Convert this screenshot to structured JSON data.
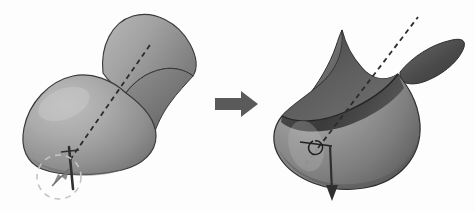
{
  "figure": {
    "type": "diagram",
    "background_color": "#fdfdfd",
    "panels": [
      {
        "id": "before",
        "name": "left-surface",
        "description": "Smooth closed grey surface with a large lower lobe and an upper flaring lobe, pierced by a dashed rotation axis",
        "surface_fill_light": "#b4b4b4",
        "surface_fill_mid": "#939393",
        "surface_fill_dark": "#6e6e6e",
        "outline_color": "#3a3a3a",
        "axis_style": "dashed",
        "axis_color": "#2b2b2b",
        "annotations": [
          {
            "name": "rotation-circle",
            "shape": "dashed-circle-arrow",
            "color": "#c6c6c6"
          },
          {
            "name": "axis-needle",
            "shape": "vertical-pin",
            "color": "#2f2f2f"
          }
        ]
      },
      {
        "id": "after",
        "name": "right-surface",
        "description": "Everted bowl-shaped surface showing its dark interior, with a pointed cusp and a leaf-shaped flap to the right, pierced by the same dashed axis",
        "surface_fill_light": "#a9a9a9",
        "surface_fill_mid": "#8a8a8a",
        "surface_fill_dark": "#545454",
        "interior_fill": "#4a4a4a",
        "outline_color": "#2e2e2e",
        "axis_style": "dashed",
        "axis_color": "#2b2b2b",
        "annotations": [
          {
            "name": "down-arrow",
            "shape": "vertical-arrow",
            "color": "#2f2f2f"
          },
          {
            "name": "intersection-marker",
            "shape": "small-loop",
            "color": "#1f1f1f"
          }
        ]
      }
    ],
    "transform_arrow": {
      "name": "transform-arrow",
      "direction": "right",
      "color": "#5a5a5a",
      "label": ""
    }
  }
}
